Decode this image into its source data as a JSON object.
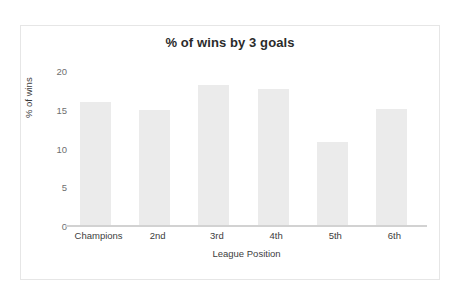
{
  "figure": {
    "background_color": "#ffffff",
    "border_color": "#e6e6e6",
    "bar_color": "#ebebeb",
    "axis_color": "#d2d2d2"
  },
  "chart_data": {
    "type": "bar",
    "title": "% of wins by 3 goals",
    "xlabel": "League Position",
    "ylabel": "% of wins",
    "categories": [
      "Champions",
      "2nd",
      "3rd",
      "4th",
      "5th",
      "6th"
    ],
    "values": [
      16,
      15,
      18.2,
      17.7,
      10.8,
      15.1
    ],
    "ylim": [
      0,
      20
    ],
    "yticks": [
      0,
      5,
      10,
      15,
      20
    ],
    "ytick_labels": [
      "0",
      "5",
      "10",
      "15",
      "20"
    ],
    "grid": false,
    "legend": null
  }
}
